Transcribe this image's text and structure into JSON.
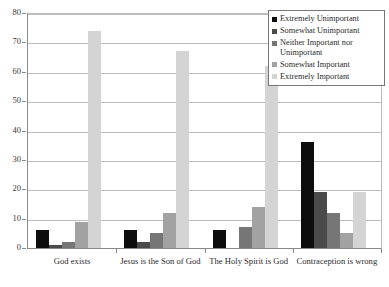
{
  "chart_data": {
    "type": "bar",
    "title": "",
    "xlabel": "",
    "ylabel": "",
    "ylim": [
      0,
      80
    ],
    "ytick_step": 10,
    "yticks": [
      80,
      70,
      60,
      50,
      40,
      30,
      20,
      10,
      0
    ],
    "grid": true,
    "legend_position": "top-right",
    "categories": [
      "God exists",
      "Jesus is the Son of God",
      "The Holy Spirit is God",
      "Contraception is wrong"
    ],
    "series": [
      {
        "name": "Extremely Unimportant",
        "color": "#0d0d0d",
        "values": [
          6,
          6,
          6,
          36
        ]
      },
      {
        "name": "Somewhat Unimportant",
        "color": "#4a4a4a",
        "values": [
          1,
          2,
          0,
          19
        ]
      },
      {
        "name": "Neither Important nor Unimportant",
        "color": "#767676",
        "values": [
          2,
          5,
          7,
          12
        ]
      },
      {
        "name": "Somewhat Important",
        "color": "#a2a2a2",
        "values": [
          9,
          12,
          14,
          5
        ]
      },
      {
        "name": "Extremely Important",
        "color": "#d4d4d4",
        "values": [
          74,
          67,
          62,
          19
        ]
      }
    ]
  },
  "legend": {
    "items": [
      {
        "label": "Extremely Unimportant"
      },
      {
        "label": "Somewhat Unimportant"
      },
      {
        "label": "Neither Important nor Unimportant"
      },
      {
        "label": "Somewhat Important"
      },
      {
        "label": "Extremely Important"
      }
    ]
  },
  "axes": {
    "y_axis_max": "80",
    "y_axis_min": "0"
  }
}
